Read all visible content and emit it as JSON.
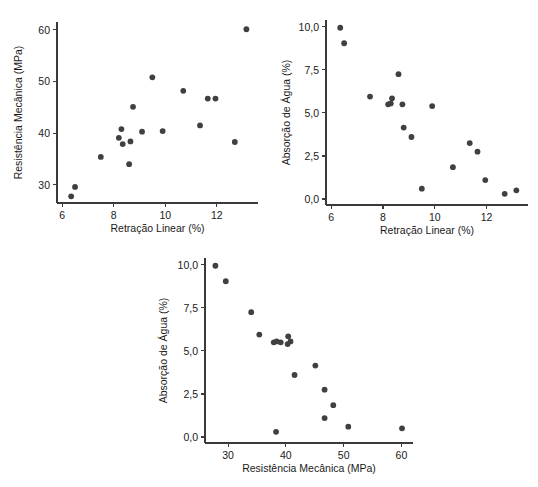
{
  "page": {
    "background_color": "#ffffff",
    "point_color": "#404040",
    "axis_color": "#3a3a3a"
  },
  "chart_data": [
    {
      "id": "chart-retracao-resistencia",
      "type": "scatter",
      "title": "",
      "xlabel": "Retração Linear (%)",
      "ylabel": "Resistência Mecânica (MPa)",
      "xlim": [
        5.8,
        13.6
      ],
      "ylim": [
        26.5,
        61.5
      ],
      "xticks": [
        6,
        8,
        10,
        12
      ],
      "xtick_labels": [
        "6",
        "8",
        "10",
        "12"
      ],
      "yticks": [
        30,
        40,
        50,
        60
      ],
      "ytick_labels": [
        "30",
        "40",
        "50",
        "60"
      ],
      "grid": false,
      "legend": false,
      "x": [
        6.35,
        6.5,
        7.5,
        8.2,
        8.3,
        8.35,
        8.6,
        8.65,
        8.75,
        9.1,
        9.5,
        9.9,
        10.7,
        11.35,
        11.65,
        11.95,
        12.7,
        13.15
      ],
      "y": [
        27.8,
        29.6,
        35.4,
        39.1,
        40.8,
        37.9,
        34.0,
        38.4,
        45.1,
        40.3,
        50.8,
        40.4,
        48.2,
        41.5,
        46.7,
        46.7,
        38.3,
        60.1
      ]
    },
    {
      "id": "chart-retracao-absorcao",
      "type": "scatter",
      "title": "",
      "xlabel": "Retração Linear (%)",
      "ylabel": "Absorção de Água (%)",
      "xlim": [
        5.8,
        13.6
      ],
      "ylim": [
        -0.35,
        10.4
      ],
      "xticks": [
        6,
        8,
        10,
        12
      ],
      "xtick_labels": [
        "6",
        "8",
        "10",
        "12"
      ],
      "yticks": [
        0.0,
        2.5,
        5.0,
        7.5,
        10.0
      ],
      "ytick_labels": [
        "0,0",
        "2,5",
        "5,0",
        "7,5",
        "10,0"
      ],
      "grid": false,
      "legend": false,
      "x": [
        6.35,
        6.5,
        7.5,
        8.2,
        8.3,
        8.35,
        8.6,
        8.75,
        8.8,
        9.1,
        9.5,
        9.9,
        10.7,
        11.35,
        11.65,
        11.95,
        12.7,
        13.15
      ],
      "y": [
        9.95,
        9.05,
        5.95,
        5.5,
        5.55,
        5.85,
        7.25,
        5.5,
        4.15,
        3.6,
        0.6,
        5.4,
        1.85,
        3.25,
        2.75,
        1.1,
        0.3,
        0.5
      ]
    },
    {
      "id": "chart-resistencia-absorcao",
      "type": "scatter",
      "title": "",
      "xlabel": "Resistência Mecânica (MPa)",
      "ylabel": "Absorção de Água (%)",
      "xlim": [
        26.0,
        62.0
      ],
      "ylim": [
        -0.35,
        10.4
      ],
      "xticks": [
        30,
        40,
        50,
        60
      ],
      "xtick_labels": [
        "30",
        "40",
        "50",
        "60"
      ],
      "yticks": [
        0.0,
        2.5,
        5.0,
        7.5,
        10.0
      ],
      "ytick_labels": [
        "0,0",
        "2,5",
        "5,0",
        "7,5",
        "10,0"
      ],
      "grid": false,
      "legend": false,
      "x": [
        27.8,
        29.6,
        34.0,
        35.4,
        37.9,
        38.3,
        38.4,
        39.1,
        40.3,
        40.4,
        40.8,
        41.5,
        45.1,
        46.7,
        46.7,
        48.2,
        50.8,
        60.1
      ],
      "y": [
        9.95,
        9.05,
        7.25,
        5.95,
        5.5,
        0.3,
        5.55,
        5.5,
        5.4,
        5.85,
        5.55,
        3.6,
        4.15,
        2.75,
        1.1,
        1.85,
        0.6,
        0.5
      ]
    }
  ]
}
